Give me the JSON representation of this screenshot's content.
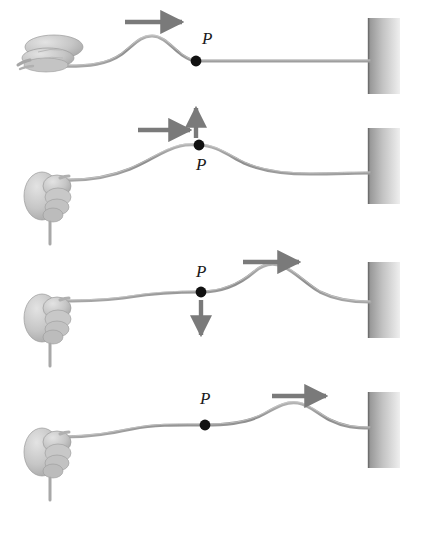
{
  "figure": {
    "background_color": "#ffffff",
    "rope_color": "#8f8f8f",
    "arrow_color": "#7a7a7a",
    "point_color": "#111111",
    "wall_color_dark": "#8a8a8a",
    "wall_color_light": "#e8e8e8",
    "hand_color": "#c9c9c9",
    "point_label": "P",
    "panel_count": 4
  },
  "panels": [
    {
      "id": "panel-1",
      "index": 1,
      "point_label": "P",
      "hand_orientation": "horizontal",
      "pulse_position": "near-hand",
      "pulse_crest_x": 150,
      "point_x": 196,
      "point_y": 61,
      "label_x": 202,
      "label_y": 44,
      "arrows": [
        {
          "name": "wave-direction-arrow",
          "direction": "right",
          "x": 125,
          "y": 22,
          "length": 62
        }
      ],
      "wall": {
        "x": 368,
        "y": 18,
        "width": 32,
        "height": 76
      },
      "rope_path": "M 57,66 C 90,66 108,64 122,54 C 134,45 140,36 152,36 C 164,36 172,48 182,55 C 188,59 192,61 196,61 L 370,61",
      "caption": "Hand flicks rope; pulse has formed left of point P which is still at rest."
    },
    {
      "id": "panel-2",
      "index": 2,
      "point_label": "P",
      "hand_orientation": "vertical",
      "pulse_position": "at-point-P",
      "pulse_crest_x": 196,
      "point_x": 199,
      "point_y": 145,
      "label_x": 200,
      "label_y": 170,
      "arrows": [
        {
          "name": "wave-direction-arrow",
          "direction": "right",
          "x": 138,
          "y": 130,
          "length": 58
        },
        {
          "name": "point-velocity-arrow",
          "direction": "up",
          "x": 196,
          "y": 108,
          "length": 32
        }
      ],
      "wall": {
        "x": 368,
        "y": 128,
        "width": 32,
        "height": 76
      },
      "rope_path": "M 62,180 C 90,180 110,176 130,168 C 150,160 163,150 180,146 C 188,144 194,145 199,145 C 215,145 228,155 244,163 C 262,171 285,174 310,174 C 335,174 355,173 370,173",
      "caption": "Pulse has reached P; P moves upward at maximum speed."
    },
    {
      "id": "panel-3",
      "index": 3,
      "point_label": "P",
      "hand_orientation": "vertical",
      "pulse_position": "right-of-point-P",
      "pulse_crest_x": 268,
      "point_x": 201,
      "point_y": 292,
      "label_x": 202,
      "label_y": 277,
      "arrows": [
        {
          "name": "wave-direction-arrow",
          "direction": "right",
          "x": 243,
          "y": 262,
          "length": 62
        },
        {
          "name": "point-velocity-arrow",
          "direction": "down",
          "x": 201,
          "y": 302,
          "length": 36
        }
      ],
      "wall": {
        "x": 368,
        "y": 262,
        "width": 32,
        "height": 76
      },
      "rope_path": "M 62,300 C 90,300 110,299 130,296 C 155,292 175,292 201,292 C 222,292 240,284 254,272 C 262,265 272,262 282,266 C 296,272 306,284 320,292 C 336,300 352,302 370,302",
      "caption": "Pulse has passed P; P moves downward back toward equilibrium."
    },
    {
      "id": "panel-4",
      "index": 4,
      "point_label": "P",
      "hand_orientation": "vertical",
      "pulse_position": "near-wall",
      "pulse_crest_x": 296,
      "point_x": 205,
      "point_y": 425,
      "label_x": 205,
      "label_y": 404,
      "arrows": [
        {
          "name": "wave-direction-arrow",
          "direction": "right",
          "x": 272,
          "y": 396,
          "length": 60
        }
      ],
      "wall": {
        "x": 368,
        "y": 392,
        "width": 32,
        "height": 76
      },
      "rope_path": "M 62,436 C 92,436 112,432 132,428 C 158,423 182,425 205,425 C 228,425 248,423 264,414 C 278,406 288,401 298,403 C 310,405 318,414 330,420 C 344,427 356,428 370,428",
      "caption": "Pulse approaches the fixed wall; P is back at rest in equilibrium."
    }
  ],
  "annotations": {
    "wave_direction_label": "wave travel direction",
    "point_velocity_up_label": "P moving up",
    "point_velocity_down_label": "P moving down",
    "wall_label": "fixed end / wall"
  }
}
